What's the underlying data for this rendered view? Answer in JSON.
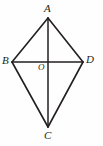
{
  "figure": {
    "name": "kite-abcd-with-diagonals",
    "background_color": "#fefefe",
    "stroke_color": "#231f20",
    "label_color": "#231f20",
    "canvas": {
      "width": 103,
      "height": 146
    },
    "points": {
      "A": {
        "label": "A",
        "x": 48,
        "y": 18
      },
      "B": {
        "label": "B",
        "x": 12,
        "y": 62
      },
      "C": {
        "label": "C",
        "x": 48,
        "y": 127
      },
      "D": {
        "label": "D",
        "x": 83,
        "y": 62
      },
      "O": {
        "label": "O",
        "x": 48,
        "y": 62
      }
    },
    "segments": [
      {
        "name": "side-AB",
        "from": "A",
        "to": "B",
        "width": 1.6
      },
      {
        "name": "side-AD",
        "from": "A",
        "to": "D",
        "width": 1.6
      },
      {
        "name": "side-BC",
        "from": "B",
        "to": "C",
        "width": 1.6
      },
      {
        "name": "side-CD",
        "from": "C",
        "to": "D",
        "width": 1.6
      },
      {
        "name": "diagonal-AC",
        "from": "A",
        "to": "C",
        "width": 1.5
      },
      {
        "name": "diagonal-BD",
        "from": "B",
        "to": "D",
        "width": 1.5
      }
    ]
  }
}
